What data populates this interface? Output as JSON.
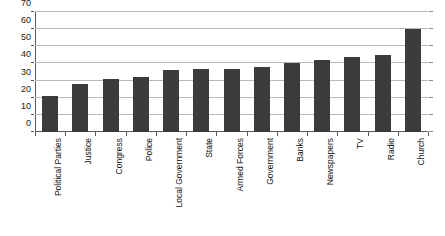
{
  "chart_data": {
    "type": "bar",
    "title": "",
    "subtitle": "",
    "xlabel": "",
    "ylabel": "",
    "categories": [
      "Political Parties",
      "Justice",
      "Congress",
      "Police",
      "Local Government",
      "State",
      "Armed Forces",
      "Government",
      "Banks",
      "Newspapers",
      "TV",
      "Radio",
      "Church"
    ],
    "values": [
      21,
      28,
      31,
      32,
      36,
      36.5,
      37,
      38,
      40,
      42,
      44,
      45,
      60
    ],
    "ylim": [
      0,
      70
    ],
    "y_ticks": [
      0,
      10,
      20,
      30,
      40,
      50,
      60,
      70
    ],
    "y_tick_labels": [
      "0",
      "10",
      "20",
      "30",
      "40",
      "50",
      "60",
      "70"
    ],
    "grid": true,
    "legend": false,
    "legend_position": "none",
    "series": [
      {
        "name": "",
        "values": [
          21,
          28,
          31,
          32,
          36,
          36.5,
          37,
          38,
          40,
          42,
          44,
          45,
          60
        ]
      }
    ],
    "bar_color": "#3b3b3b",
    "grid_color": "#b9b9b9",
    "axis_color": "#5a5a5a",
    "background_color": "#ffffff"
  }
}
